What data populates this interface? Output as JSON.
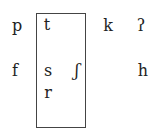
{
  "diagram": {
    "boxed_group": {
      "label": "coronal",
      "segments": [
        "t",
        "s",
        "ʃ",
        "r"
      ]
    },
    "segments": {
      "p": "p",
      "t": "t",
      "k": "k",
      "glottal_stop": "ʔ",
      "f": "f",
      "s": "s",
      "esh": "ʃ",
      "h": "h",
      "r": "r"
    },
    "rows": [
      [
        "p",
        "t",
        "",
        "k",
        "ʔ"
      ],
      [
        "f",
        "s",
        "ʃ",
        "",
        "h"
      ],
      [
        "",
        "r",
        "",
        "",
        ""
      ]
    ]
  }
}
